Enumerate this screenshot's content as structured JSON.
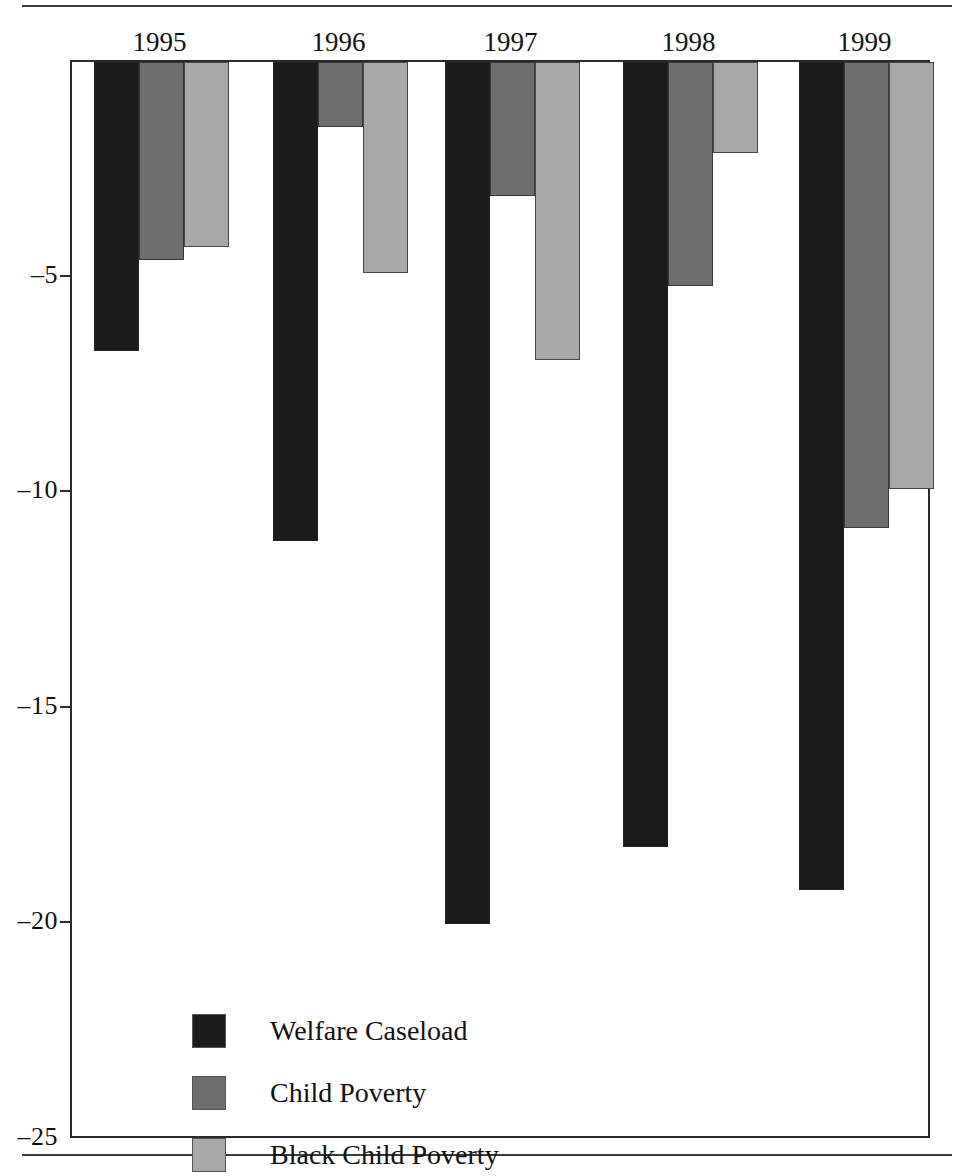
{
  "chart_data": {
    "type": "bar",
    "title": "",
    "subtitle": "",
    "xlabel": "",
    "ylabel": "",
    "categories": [
      "1995",
      "1996",
      "1997",
      "1998",
      "1999"
    ],
    "ylim": [
      -25,
      0
    ],
    "yticks": [
      -5,
      -10,
      -15,
      -20,
      -25
    ],
    "ytick_labels": [
      "–5",
      "–10",
      "–15",
      "–20",
      "–25"
    ],
    "grid": false,
    "legend_position": "inside-bottom-left",
    "series": [
      {
        "name": "Welfare Caseload",
        "color": "#1b1b1b",
        "values": [
          -6.7,
          -11.1,
          -20.0,
          -18.2,
          -19.2
        ]
      },
      {
        "name": "Child Poverty",
        "color": "#6e6e6e",
        "values": [
          -4.6,
          -1.5,
          -3.1,
          -5.2,
          -10.8
        ]
      },
      {
        "name": "Black Child Poverty",
        "color": "#a8a8a8",
        "values": [
          -4.3,
          -4.9,
          -6.9,
          -2.1,
          -9.9
        ]
      }
    ]
  },
  "axes": {
    "ytick_labels": [
      "–5",
      "–10",
      "–15",
      "–20",
      "–25"
    ],
    "xtick_labels": [
      "1995",
      "1996",
      "1997",
      "1998",
      "1999"
    ]
  },
  "legend": {
    "items": [
      {
        "label": "Welfare Caseload",
        "color": "#1b1b1b"
      },
      {
        "label": "Child Poverty",
        "color": "#6e6e6e"
      },
      {
        "label": "Black Child Poverty",
        "color": "#a8a8a8"
      }
    ]
  }
}
